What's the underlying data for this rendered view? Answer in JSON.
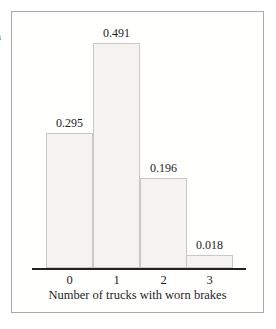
{
  "figure": {
    "clipped_left_text": "a"
  },
  "chart_data": {
    "type": "bar",
    "categories": [
      "0",
      "1",
      "2",
      "3"
    ],
    "values": [
      0.295,
      0.491,
      0.196,
      0.018
    ],
    "value_labels": [
      "0.295",
      "0.491",
      "0.196",
      "0.018"
    ],
    "title": "",
    "xlabel": "Number of trucks with worn brakes",
    "ylabel": "",
    "ylim": [
      0,
      0.5
    ],
    "grid": false,
    "legend": false,
    "colors": {
      "bar_fill": "#f4f3ef",
      "bar_border": "#c9c8c3",
      "axis_line": "#222222",
      "text": "#1d1d1d",
      "panel_border": "#a9a9a6",
      "background": "#ffffff"
    }
  }
}
